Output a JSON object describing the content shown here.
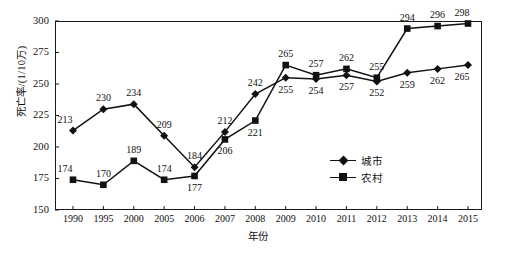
{
  "chart_data": {
    "type": "line",
    "title": "",
    "xlabel": "年份",
    "ylabel": "死亡率/(1/10万)",
    "ylim": [
      150,
      300
    ],
    "yticks": [
      150,
      175,
      200,
      225,
      250,
      275,
      300
    ],
    "grid": false,
    "legend_position": "inside-right",
    "categories": [
      "1990",
      "1995",
      "2000",
      "2005",
      "2006",
      "2007",
      "2008",
      "2009",
      "2010",
      "2011",
      "2012",
      "2013",
      "2014",
      "2015"
    ],
    "series": [
      {
        "name": "城市",
        "marker": "diamond",
        "values": [
          213,
          230,
          234,
          209,
          184,
          212,
          242,
          255,
          254,
          257,
          252,
          259,
          262,
          265
        ]
      },
      {
        "name": "农村",
        "marker": "square",
        "values": [
          174,
          170,
          189,
          174,
          177,
          206,
          221,
          265,
          257,
          262,
          255,
          294,
          296,
          298
        ]
      }
    ],
    "annotations": {
      "city_label_positions": [
        "above",
        "above",
        "above",
        "above",
        "above",
        "above",
        "above",
        "below",
        "below",
        "below",
        "below",
        "below",
        "below",
        "below"
      ],
      "rural_label_positions": [
        "above",
        "above",
        "above",
        "above",
        "below",
        "below",
        "below",
        "above",
        "above",
        "above",
        "above",
        "above",
        "above",
        "above"
      ]
    }
  },
  "axes": {
    "y_title": "死亡率/(1/10万)",
    "x_title": "年份",
    "y_tick_labels": [
      "300",
      "275",
      "250",
      "225",
      "200",
      "175",
      "150"
    ],
    "x_tick_labels": [
      "1990",
      "1995",
      "2000",
      "2005",
      "2006",
      "2007",
      "2008",
      "2009",
      "2010",
      "2011",
      "2012",
      "2013",
      "2014",
      "2015"
    ]
  },
  "legend": {
    "items": [
      {
        "label": "城市",
        "marker": "diamond"
      },
      {
        "label": "农村",
        "marker": "square"
      }
    ]
  },
  "caption": {
    "text": ""
  },
  "colors": {
    "line": "#111111",
    "frame": "#1a1a1a",
    "background": "#ffffff"
  }
}
